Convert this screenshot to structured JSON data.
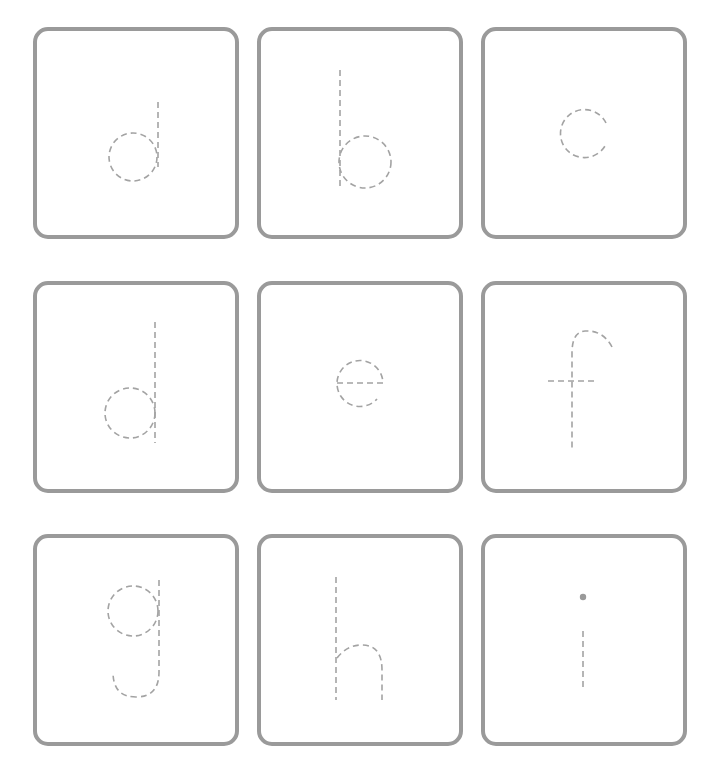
{
  "worksheet": {
    "type": "letter-tracing",
    "case": "lowercase",
    "stroke_style": "dashed",
    "colors": {
      "card_border": "#9a9a9a",
      "trace_stroke": "#a3a3a3",
      "background": "#ffffff"
    },
    "cards": [
      {
        "letter": "a",
        "row": 1,
        "col": 1
      },
      {
        "letter": "b",
        "row": 1,
        "col": 2
      },
      {
        "letter": "c",
        "row": 1,
        "col": 3
      },
      {
        "letter": "d",
        "row": 2,
        "col": 1
      },
      {
        "letter": "e",
        "row": 2,
        "col": 2
      },
      {
        "letter": "f",
        "row": 2,
        "col": 3
      },
      {
        "letter": "g",
        "row": 3,
        "col": 1
      },
      {
        "letter": "h",
        "row": 3,
        "col": 2
      },
      {
        "letter": "i",
        "row": 3,
        "col": 3
      }
    ]
  }
}
